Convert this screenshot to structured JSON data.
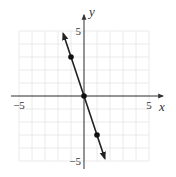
{
  "chart_data": {
    "type": "line",
    "title": "",
    "xlabel": "x",
    "ylabel": "y",
    "xlim": [
      -5,
      5
    ],
    "ylim": [
      -5,
      5
    ],
    "grid": true,
    "x_tick_labels": [
      {
        "value": -5,
        "label": "−5"
      },
      {
        "value": 5,
        "label": "5"
      }
    ],
    "y_tick_labels": [
      {
        "value": 5,
        "label": "5"
      },
      {
        "value": -5,
        "label": "−5"
      }
    ],
    "series": [
      {
        "name": "y = -3x",
        "line_extent": [
          [
            -1.6,
            4.8
          ],
          [
            1.6,
            -4.8
          ]
        ],
        "arrows_both_ends": true,
        "points": [
          {
            "x": -1,
            "y": 3
          },
          {
            "x": 0,
            "y": 0
          },
          {
            "x": 1,
            "y": -3
          }
        ]
      }
    ]
  }
}
